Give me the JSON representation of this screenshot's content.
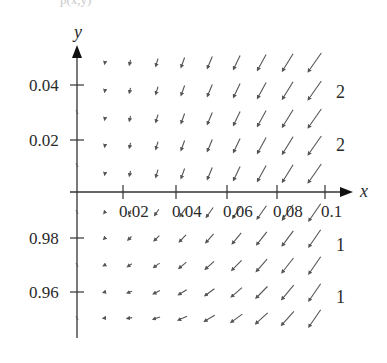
{
  "figure": {
    "top_fragment": "p(x,y)",
    "axes": {
      "x_label": "x",
      "y_label": "y",
      "x_ticks": [
        {
          "label": "0.02",
          "px": 123
        },
        {
          "label": "0.04",
          "px": 176
        },
        {
          "label": "0.06",
          "px": 227
        },
        {
          "label": "0.08",
          "px": 277
        },
        {
          "label": "0.1",
          "px": 325
        }
      ],
      "y_ticks": [
        {
          "label": "0.04",
          "py": 85
        },
        {
          "label": "0.02",
          "py": 140
        },
        {
          "label": "0.98",
          "py": 238
        },
        {
          "label": "0.96",
          "py": 292
        }
      ]
    },
    "side_labels": [
      {
        "label": "2",
        "py": 92
      },
      {
        "label": "2",
        "py": 145
      },
      {
        "label": "1",
        "py": 245
      },
      {
        "label": "1",
        "py": 297
      }
    ],
    "field": {
      "columns_px": [
        105,
        130,
        157,
        183,
        210,
        237,
        262,
        288,
        315
      ],
      "rows_px": [
        62,
        90,
        118,
        145,
        173,
        212,
        238,
        265,
        292,
        318
      ],
      "arrow_color": "#555555",
      "axis_color": "#333333"
    }
  },
  "chart_data": {
    "type": "direction_field",
    "title": "",
    "xlabel": "x",
    "ylabel": "y",
    "x_ticks": [
      "0.02",
      "0.04",
      "0.06",
      "0.08",
      "0.1"
    ],
    "y_ticks_upper": [
      "0.02",
      "0.04"
    ],
    "y_ticks_lower": [
      "0.96",
      "0.98"
    ],
    "right_labels": [
      "2",
      "2",
      "1",
      "1"
    ]
  }
}
